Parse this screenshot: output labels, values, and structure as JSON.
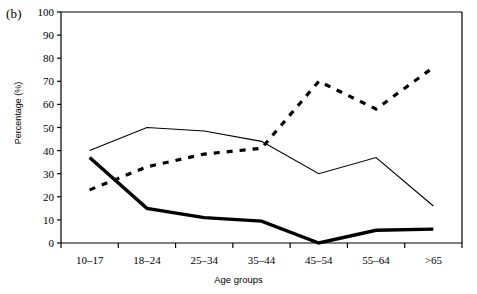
{
  "figure": {
    "panel_label": "(b)",
    "ylabel": "Percentage (%)",
    "xlabel": "Age groups"
  },
  "chart_data": {
    "type": "line",
    "title": "",
    "xlabel": "Age groups",
    "ylabel": "Percentage (%)",
    "categories": [
      "10–17",
      "18–24",
      "25–34",
      "35–44",
      "45–54",
      "55–64",
      ">65"
    ],
    "ylim": [
      0,
      100
    ],
    "yticks": [
      0,
      10,
      20,
      30,
      40,
      50,
      60,
      70,
      80,
      90,
      100
    ],
    "grid": false,
    "legend": "none",
    "series": [
      {
        "name": "thin-solid-series",
        "style": "solid-thin",
        "color": "#000000",
        "values": [
          40,
          50,
          48.5,
          44,
          30,
          37,
          16
        ]
      },
      {
        "name": "dashed-series",
        "style": "dashed",
        "color": "#000000",
        "values": [
          23,
          33,
          38.5,
          41,
          70,
          58,
          76
        ]
      },
      {
        "name": "thick-solid-series",
        "style": "solid-thick",
        "color": "#000000",
        "values": [
          37,
          15,
          11,
          9.5,
          0,
          5.5,
          6
        ]
      }
    ]
  }
}
